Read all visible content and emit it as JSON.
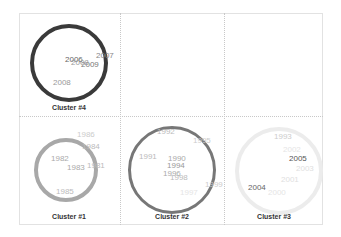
{
  "chart_data": {
    "type": "scatter",
    "subtype": "cluster-bubble-grid",
    "title": "",
    "grid": {
      "rows": 2,
      "cols": 3,
      "gridlines": "dotted"
    },
    "clusters": [
      {
        "name": "Cluster #4",
        "cell": {
          "row": 0,
          "col": 0
        },
        "ring_color": "#3a3a3a",
        "ring_radius_px": 39,
        "ring_width_px": 4,
        "labels": [
          {
            "text": "2006",
            "x": 65,
            "y": 61,
            "color": "#666666"
          },
          {
            "text": "2007",
            "x": 96,
            "y": 57,
            "color": "#888888"
          },
          {
            "text": "2009",
            "x": 81,
            "y": 66,
            "color": "#777777"
          },
          {
            "text": "2008",
            "x": 71,
            "y": 64,
            "color": "#999999"
          },
          {
            "text": "2008",
            "x": 53,
            "y": 84,
            "color": "#999999"
          }
        ]
      },
      {
        "name": "Cluster #1",
        "cell": {
          "row": 1,
          "col": 0
        },
        "ring_color": "#a8a8a8",
        "ring_radius_px": 32,
        "ring_width_px": 4,
        "labels": [
          {
            "text": "1986",
            "x": 77,
            "y": 136,
            "color": "#cccccc"
          },
          {
            "text": "1984",
            "x": 82,
            "y": 148,
            "color": "#bbbbbb"
          },
          {
            "text": "1982",
            "x": 51,
            "y": 160,
            "color": "#aaaaaa"
          },
          {
            "text": "1983",
            "x": 67,
            "y": 169,
            "color": "#aaaaaa"
          },
          {
            "text": "1981",
            "x": 87,
            "y": 167,
            "color": "#bbbbbb"
          },
          {
            "text": "1985",
            "x": 56,
            "y": 193,
            "color": "#bbbbbb"
          }
        ]
      },
      {
        "name": "Cluster #2",
        "cell": {
          "row": 1,
          "col": 1
        },
        "ring_color": "#777777",
        "ring_radius_px": 44,
        "ring_width_px": 3,
        "labels": [
          {
            "text": "1992",
            "x": 157,
            "y": 133,
            "color": "#bbbbbb"
          },
          {
            "text": "1995",
            "x": 193,
            "y": 142,
            "color": "#cccccc"
          },
          {
            "text": "1991",
            "x": 139,
            "y": 158,
            "color": "#bbbbbb"
          },
          {
            "text": "1990",
            "x": 168,
            "y": 160,
            "color": "#aaaaaa"
          },
          {
            "text": "1994",
            "x": 167,
            "y": 167,
            "color": "#999999"
          },
          {
            "text": "1996",
            "x": 163,
            "y": 175,
            "color": "#aaaaaa"
          },
          {
            "text": "1998",
            "x": 170,
            "y": 179,
            "color": "#bbbbbb"
          },
          {
            "text": "1999",
            "x": 205,
            "y": 186,
            "color": "#cccccc"
          },
          {
            "text": "1997",
            "x": 180,
            "y": 194,
            "color": "#e5e5e5"
          }
        ]
      },
      {
        "name": "Cluster #3",
        "cell": {
          "row": 1,
          "col": 2
        },
        "ring_color": "#ececec",
        "ring_radius_px": 44,
        "ring_width_px": 4,
        "labels": [
          {
            "text": "1993",
            "x": 274,
            "y": 138,
            "color": "#cccccc"
          },
          {
            "text": "2002",
            "x": 283,
            "y": 151,
            "color": "#e5e5e5"
          },
          {
            "text": "2005",
            "x": 289,
            "y": 160,
            "color": "#555555"
          },
          {
            "text": "2003",
            "x": 296,
            "y": 170,
            "color": "#e0e0e0"
          },
          {
            "text": "2001",
            "x": 281,
            "y": 181,
            "color": "#e0e0e0"
          },
          {
            "text": "2004",
            "x": 248,
            "y": 189,
            "color": "#666666"
          },
          {
            "text": "2000",
            "x": 268,
            "y": 194,
            "color": "#e5e5e5"
          }
        ]
      }
    ],
    "empty_cells": [
      {
        "row": 0,
        "col": 1
      },
      {
        "row": 0,
        "col": 2
      }
    ],
    "xlabel": "",
    "ylabel": ""
  }
}
